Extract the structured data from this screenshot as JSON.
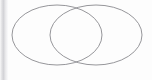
{
  "canvas": {
    "width": 152,
    "height": 80,
    "background_color": "#fdfdfd"
  },
  "diagram": {
    "kind": "venn-two-set",
    "title": "",
    "stroke_color": "#8a8a8f",
    "stroke_width": 1,
    "fill": "none",
    "left_set": {
      "label": "",
      "center_x": 57,
      "center_y": 35,
      "radius_x": 45,
      "radius_y": 30
    },
    "right_set": {
      "label": "",
      "center_x": 96,
      "center_y": 35,
      "radius_x": 46,
      "radius_y": 30
    },
    "intersection": {
      "label": "",
      "upper_crossing_x": 77,
      "upper_crossing_y": 15,
      "lower_crossing_x": 77,
      "lower_crossing_y": 56
    }
  },
  "left_edge": {
    "shadow_color": "#d2d2d6",
    "width": 8
  }
}
